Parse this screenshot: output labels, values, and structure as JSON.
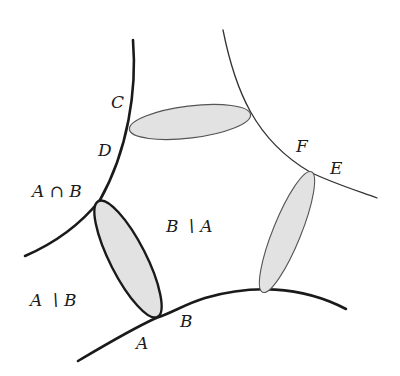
{
  "diagram": {
    "type": "set-boundaries-with-tubes",
    "colors": {
      "background": "#ffffff",
      "stroke_dark": "#1a1a1a",
      "stroke_gray": "#555555",
      "fill_gray": "#e2e2e2"
    },
    "labels": {
      "C": "C",
      "D": "D",
      "F": "F",
      "E": "E",
      "a_cap_b": "A ∩ B",
      "b_minus_a": "B ∖ A",
      "a_minus_b": "A ∖ B",
      "A": "A",
      "B": "B"
    },
    "curves": [
      {
        "name": "left-curve",
        "weight": "thick"
      },
      {
        "name": "bottom-curve",
        "weight": "thick"
      },
      {
        "name": "right-curve",
        "weight": "thin"
      }
    ],
    "ellipses": [
      {
        "name": "top-ellipse",
        "connects": [
          "C/D",
          "right-curve"
        ],
        "outline": "thin"
      },
      {
        "name": "left-ellipse",
        "connects": [
          "A∩B",
          "A/B"
        ],
        "outline": "thick"
      },
      {
        "name": "right-ellipse",
        "connects": [
          "E/F",
          "bottom-curve"
        ],
        "outline": "thin"
      }
    ]
  }
}
